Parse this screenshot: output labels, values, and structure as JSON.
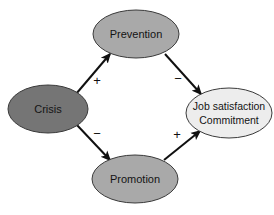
{
  "diagram": {
    "type": "path-model",
    "background_color": "#ffffff",
    "nodes": [
      {
        "id": "crisis",
        "label": "Crisis",
        "shape": "ellipse",
        "cx": 48,
        "cy": 109,
        "rx": 40,
        "ry": 24,
        "fill": "#757575",
        "stroke": "#3a3a3a",
        "text_color": "#141414"
      },
      {
        "id": "prevention",
        "label": "Prevention",
        "shape": "ellipse",
        "cx": 136,
        "cy": 34,
        "rx": 43,
        "ry": 24,
        "fill": "#a9a9a9",
        "stroke": "#3a3a3a",
        "text_color": "#141414"
      },
      {
        "id": "promotion",
        "label": "Promotion",
        "shape": "ellipse",
        "cx": 135,
        "cy": 179,
        "rx": 43,
        "ry": 24,
        "fill": "#a9a9a9",
        "stroke": "#3a3a3a",
        "text_color": "#141414"
      },
      {
        "id": "outcome",
        "label_line1": "Job satisfaction",
        "label_line2": "Commitment",
        "shape": "ellipse",
        "cx": 229,
        "cy": 113,
        "rx": 43,
        "ry": 25,
        "fill": "#ededed",
        "stroke": "#3a3a3a",
        "text_color": "#141414"
      }
    ],
    "edges": [
      {
        "id": "crisis-to-prevention",
        "from": "crisis",
        "to": "prevention",
        "sign": "+",
        "sign_x": 97,
        "sign_y": 82,
        "x1": 76,
        "y1": 94,
        "x2": 110,
        "y2": 54,
        "arrowhead": true
      },
      {
        "id": "crisis-to-promotion",
        "from": "crisis",
        "to": "promotion",
        "sign": "−",
        "sign_x": 97,
        "sign_y": 135,
        "x1": 76,
        "y1": 124,
        "x2": 110,
        "y2": 160,
        "arrowhead": true
      },
      {
        "id": "prevention-to-outcome",
        "from": "prevention",
        "to": "outcome",
        "sign": "−",
        "sign_x": 178,
        "sign_y": 80,
        "x1": 165,
        "y1": 54,
        "x2": 201,
        "y2": 94,
        "arrowhead": true
      },
      {
        "id": "promotion-to-outcome",
        "from": "promotion",
        "to": "outcome",
        "sign": "+",
        "sign_x": 177,
        "sign_y": 136,
        "x1": 164,
        "y1": 160,
        "x2": 200,
        "y2": 131,
        "arrowhead": true
      }
    ]
  }
}
